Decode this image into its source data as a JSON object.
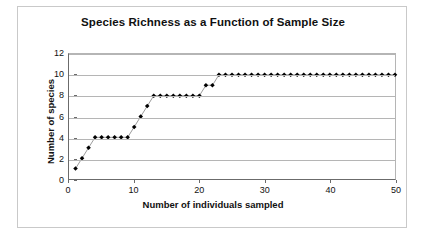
{
  "chart_data": {
    "type": "line",
    "title": "Species Richness as a Function of Sample Size",
    "xlabel": "Number of individuals sampled",
    "ylabel": "Number of species",
    "xlim": [
      0,
      50
    ],
    "ylim": [
      0,
      12
    ],
    "xticks": [
      0,
      10,
      20,
      30,
      40,
      50
    ],
    "yticks": [
      0,
      2,
      4,
      6,
      8,
      10,
      12
    ],
    "grid": "horizontal",
    "legend": "none",
    "marker": "filled-diamond",
    "marker_color": "#000000",
    "line_color": "#808080",
    "series": [
      {
        "name": "Species accumulation",
        "x": [
          1,
          2,
          3,
          4,
          5,
          6,
          7,
          8,
          9,
          10,
          11,
          12,
          13,
          14,
          15,
          16,
          17,
          18,
          19,
          20,
          21,
          22,
          23,
          24,
          25,
          26,
          27,
          28,
          29,
          30,
          31,
          32,
          33,
          34,
          35,
          36,
          37,
          38,
          39,
          40,
          41,
          42,
          43,
          44,
          45,
          46,
          47,
          48,
          49,
          50
        ],
        "values": [
          1,
          2,
          3,
          4,
          4,
          4,
          4,
          4,
          4,
          5,
          6,
          7,
          8,
          8,
          8,
          8,
          8,
          8,
          8,
          8,
          9,
          9,
          10,
          10,
          10,
          10,
          10,
          10,
          10,
          10,
          10,
          10,
          10,
          10,
          10,
          10,
          10,
          10,
          10,
          10,
          10,
          10,
          10,
          10,
          10,
          10,
          10,
          10,
          10,
          10
        ]
      }
    ]
  }
}
